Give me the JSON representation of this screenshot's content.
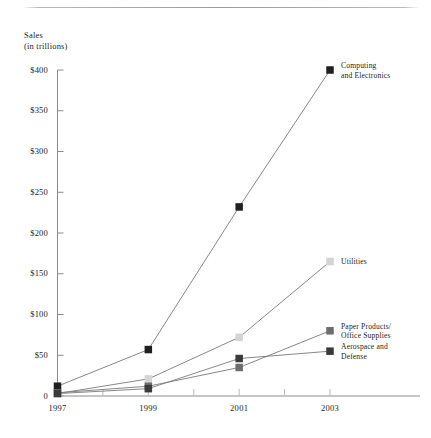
{
  "axis_title": "Sales\n(in trillions)",
  "chart_data": {
    "type": "line",
    "title": "Sales (in trillions)",
    "xlabel": "",
    "ylabel": "Sales (in trillions)",
    "ylim": [
      0,
      400
    ],
    "xlim": [
      1997,
      2003
    ],
    "grid": false,
    "legend_position": "right-inline",
    "x": [
      1997,
      1998,
      1999,
      2000,
      2001,
      2002,
      2003
    ],
    "categories": [
      "1997",
      "1999",
      "2001",
      "2003"
    ],
    "ytick_labels": [
      "$400",
      "$350",
      "$300",
      "$250",
      "$200",
      "$150",
      "$100",
      "$50",
      "0"
    ],
    "ytick_values": [
      400,
      350,
      300,
      250,
      200,
      150,
      100,
      50,
      0
    ],
    "xtick_labels": [
      "1997",
      "1999",
      "2001",
      "2003"
    ],
    "xtick_values": [
      1997,
      1999,
      2001,
      2003
    ],
    "series": [
      {
        "name": "Computing\nand Electronics",
        "label": "Computing\nand Electronics",
        "color": "#231f20",
        "marker": "square",
        "points": [
          {
            "x": 1997,
            "y": 12
          },
          {
            "x": 1999,
            "y": 57
          },
          {
            "x": 2001,
            "y": 232
          },
          {
            "x": 2003,
            "y": 400
          }
        ],
        "values": [
          12,
          57,
          232,
          400
        ]
      },
      {
        "name": "Utilities",
        "label": "Utilities",
        "color": "#d4d4d4",
        "marker": "square",
        "points": [
          {
            "x": 1997,
            "y": 3
          },
          {
            "x": 1999,
            "y": 21
          },
          {
            "x": 2001,
            "y": 72
          },
          {
            "x": 2003,
            "y": 165
          }
        ],
        "values": [
          3,
          21,
          72,
          165
        ]
      },
      {
        "name": "Paper Products/\nOffice Supplies",
        "label": "Paper Products/\nOffice Supplies",
        "color": "#6d6d6d",
        "marker": "square",
        "points": [
          {
            "x": 1997,
            "y": 4
          },
          {
            "x": 1999,
            "y": 12
          },
          {
            "x": 2001,
            "y": 35
          },
          {
            "x": 2003,
            "y": 80
          }
        ],
        "values": [
          4,
          12,
          35,
          80
        ]
      },
      {
        "name": "Aerospace and\nDefense",
        "label": "Aerospace and\nDefense",
        "color": "#3a3a3a",
        "marker": "square",
        "points": [
          {
            "x": 1997,
            "y": 3
          },
          {
            "x": 1999,
            "y": 9
          },
          {
            "x": 2001,
            "y": 46
          },
          {
            "x": 2003,
            "y": 55
          }
        ],
        "values": [
          3,
          9,
          46,
          55
        ]
      }
    ]
  }
}
